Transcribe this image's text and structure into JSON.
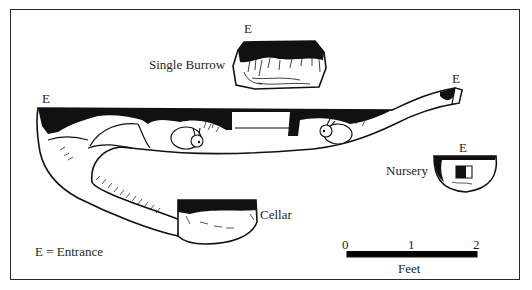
{
  "figure": {
    "type": "burrow-diagram",
    "labels": {
      "single_burrow": "Single Burrow",
      "nursery": "Nursery",
      "cellar": "Cellar",
      "entrance_marker": "E"
    },
    "legend": {
      "text": "E = Entrance"
    },
    "scale_bar": {
      "ticks": [
        "0",
        "1",
        "2"
      ],
      "unit": "Feet"
    },
    "chambers": [
      {
        "name": "Main tunnel",
        "entrances": 2
      },
      {
        "name": "Single Burrow",
        "entrances": 1
      },
      {
        "name": "Nursery",
        "entrances": 1
      },
      {
        "name": "Cellar",
        "entrances": 0
      }
    ],
    "colors": {
      "ink": "#111111",
      "paper": "#ffffff",
      "frame": "#2a2a2a"
    }
  }
}
